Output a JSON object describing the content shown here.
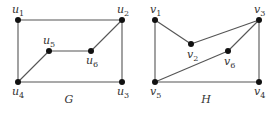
{
  "graphs": [
    {
      "id": "G",
      "caption": "G",
      "caption_pos": [
        69,
        103
      ],
      "nodes": [
        {
          "id": "u1",
          "label": "u",
          "sub": "1",
          "x": 18,
          "y": 20,
          "lx": 12,
          "ly": 13
        },
        {
          "id": "u2",
          "label": "u",
          "sub": "2",
          "x": 122,
          "y": 20,
          "lx": 117,
          "ly": 13
        },
        {
          "id": "u3",
          "label": "u",
          "sub": "3",
          "x": 122,
          "y": 82,
          "lx": 117,
          "ly": 95
        },
        {
          "id": "u4",
          "label": "u",
          "sub": "4",
          "x": 18,
          "y": 82,
          "lx": 12,
          "ly": 95
        },
        {
          "id": "u5",
          "label": "u",
          "sub": "5",
          "x": 49,
          "y": 51,
          "lx": 43,
          "ly": 44
        },
        {
          "id": "u6",
          "label": "u",
          "sub": "6",
          "x": 91,
          "y": 51,
          "lx": 86,
          "ly": 64
        }
      ],
      "edges": [
        [
          "u1",
          "u2"
        ],
        [
          "u1",
          "u4"
        ],
        [
          "u2",
          "u3"
        ],
        [
          "u4",
          "u3"
        ],
        [
          "u2",
          "u6"
        ],
        [
          "u6",
          "u5"
        ],
        [
          "u5",
          "u4"
        ]
      ]
    },
    {
      "id": "H",
      "caption": "H",
      "caption_pos": [
        206,
        103
      ],
      "nodes": [
        {
          "id": "v1",
          "label": "v",
          "sub": "1",
          "x": 155,
          "y": 20,
          "lx": 150,
          "ly": 13
        },
        {
          "id": "v2",
          "label": "v",
          "sub": "2",
          "x": 191,
          "y": 44,
          "lx": 187,
          "ly": 58
        },
        {
          "id": "v3",
          "label": "v",
          "sub": "3",
          "x": 259,
          "y": 20,
          "lx": 254,
          "ly": 13
        },
        {
          "id": "v4",
          "label": "v",
          "sub": "4",
          "x": 259,
          "y": 82,
          "lx": 254,
          "ly": 95
        },
        {
          "id": "v5",
          "label": "v",
          "sub": "5",
          "x": 155,
          "y": 82,
          "lx": 150,
          "ly": 95
        },
        {
          "id": "v6",
          "label": "v",
          "sub": "6",
          "x": 228,
          "y": 51,
          "lx": 224,
          "ly": 65
        }
      ],
      "edges": [
        [
          "v1",
          "v2"
        ],
        [
          "v2",
          "v3"
        ],
        [
          "v1",
          "v5"
        ],
        [
          "v3",
          "v4"
        ],
        [
          "v5",
          "v4"
        ],
        [
          "v3",
          "v6"
        ],
        [
          "v6",
          "v5"
        ]
      ]
    }
  ],
  "colors": {
    "edge": "#555555",
    "node": "#111111",
    "text": "#333333"
  }
}
